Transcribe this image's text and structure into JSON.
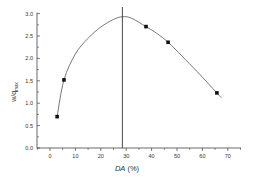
{
  "chart_data": {
    "type": "scatter",
    "title": "",
    "xlabel": "DA (%)",
    "xlabel_italic_part": "DA",
    "xlabel_rest": " (%)",
    "ylabel": "w/q_max",
    "ylabel_main": "w/q",
    "ylabel_sub": "max",
    "xlim": [
      -5,
      75
    ],
    "ylim": [
      0,
      3.0
    ],
    "xticks": [
      0,
      10,
      20,
      30,
      40,
      50,
      60,
      70
    ],
    "xtick_labels": [
      "0",
      "10",
      "20",
      "30",
      "40",
      "50",
      "60",
      "70"
    ],
    "yticks": [
      0.0,
      0.5,
      1.0,
      1.5,
      2.0,
      2.5,
      3.0
    ],
    "ytick_labels": [
      "0.0",
      "0.5",
      "1.0",
      "1.5",
      "2.0",
      "2.5",
      "3.0"
    ],
    "grid": false,
    "legend": null,
    "series": [
      {
        "name": "measured",
        "marker": "square",
        "x": [
          2.8,
          5.5,
          37.8,
          46.5,
          65.7
        ],
        "y": [
          0.7,
          1.52,
          2.71,
          2.36,
          1.23
        ]
      },
      {
        "name": "fit curve",
        "style": "line",
        "x": [
          2.8,
          5.5,
          10,
          15,
          20,
          25,
          28.5,
          32,
          37.8,
          42,
          46.5,
          52,
          58,
          65.7,
          67.5
        ],
        "y": [
          0.7,
          1.52,
          2.1,
          2.45,
          2.7,
          2.87,
          2.93,
          2.9,
          2.71,
          2.56,
          2.36,
          2.05,
          1.7,
          1.23,
          1.12
        ]
      }
    ],
    "annotations": [
      {
        "type": "vertical-line",
        "x": 28.5,
        "label": "maximum at DA ≈ 28.5%"
      }
    ]
  }
}
